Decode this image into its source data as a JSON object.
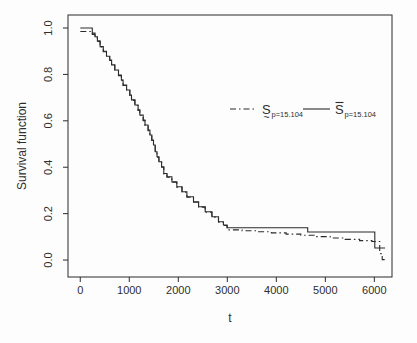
{
  "figure": {
    "background": "#fdfdfd",
    "line_color": "#2b2b2b",
    "text_color": "#2e2e2e"
  },
  "chart_data": {
    "type": "line",
    "subtype": "step-survival-curves",
    "title": "",
    "xlabel": "t",
    "ylabel": "Survival function",
    "x_range": [
      -250,
      6360
    ],
    "y_range": [
      -0.073,
      1.056
    ],
    "x_ticks": [
      0,
      1000,
      2000,
      3000,
      4000,
      5000,
      6000
    ],
    "x_tick_labels": [
      "0",
      "1000",
      "2000",
      "3000",
      "4000",
      "5000",
      "6000"
    ],
    "y_ticks": [
      0.0,
      0.2,
      0.4,
      0.6,
      0.8,
      1.0
    ],
    "y_tick_labels": [
      "0.0",
      "0.2",
      "0.4",
      "0.6",
      "0.8",
      "1.0"
    ],
    "grid": false,
    "legend_position": "inside-right-upper",
    "series": [
      {
        "name": "S~ (p=15.104) empirical estimator",
        "line_style": "solid",
        "start": [
          0,
          1.0
        ],
        "steps": [
          [
            245,
            0.978
          ],
          [
            300,
            0.962
          ],
          [
            350,
            0.945
          ],
          [
            405,
            0.92
          ],
          [
            470,
            0.9
          ],
          [
            535,
            0.878
          ],
          [
            600,
            0.862
          ],
          [
            640,
            0.841
          ],
          [
            705,
            0.819
          ],
          [
            780,
            0.797
          ],
          [
            840,
            0.776
          ],
          [
            875,
            0.754
          ],
          [
            945,
            0.733
          ],
          [
            1010,
            0.711
          ],
          [
            1045,
            0.69
          ],
          [
            1115,
            0.668
          ],
          [
            1180,
            0.647
          ],
          [
            1215,
            0.625
          ],
          [
            1285,
            0.603
          ],
          [
            1320,
            0.582
          ],
          [
            1385,
            0.56
          ],
          [
            1420,
            0.539
          ],
          [
            1460,
            0.517
          ],
          [
            1495,
            0.496
          ],
          [
            1530,
            0.467
          ],
          [
            1565,
            0.445
          ],
          [
            1605,
            0.424
          ],
          [
            1660,
            0.402
          ],
          [
            1705,
            0.373
          ],
          [
            1770,
            0.359
          ],
          [
            1870,
            0.337
          ],
          [
            1970,
            0.316
          ],
          [
            2075,
            0.294
          ],
          [
            2175,
            0.273
          ],
          [
            2310,
            0.251
          ],
          [
            2415,
            0.23
          ],
          [
            2550,
            0.208
          ],
          [
            2685,
            0.187
          ],
          [
            2820,
            0.165
          ],
          [
            2920,
            0.151
          ],
          [
            2995,
            0.139
          ],
          [
            4640,
            0.121
          ],
          [
            6010,
            0.052
          ]
        ],
        "end_t": 6220
      },
      {
        "name": "S-bar (p=15.104) fitted model",
        "line_style": "dashdot",
        "start": [
          0,
          0.985
        ],
        "steps": [
          [
            245,
            0.972
          ],
          [
            300,
            0.958
          ],
          [
            350,
            0.942
          ],
          [
            405,
            0.918
          ],
          [
            470,
            0.898
          ],
          [
            535,
            0.876
          ],
          [
            600,
            0.86
          ],
          [
            640,
            0.839
          ],
          [
            705,
            0.817
          ],
          [
            780,
            0.795
          ],
          [
            840,
            0.774
          ],
          [
            875,
            0.752
          ],
          [
            945,
            0.731
          ],
          [
            1010,
            0.709
          ],
          [
            1045,
            0.688
          ],
          [
            1115,
            0.666
          ],
          [
            1180,
            0.645
          ],
          [
            1215,
            0.623
          ],
          [
            1285,
            0.601
          ],
          [
            1320,
            0.58
          ],
          [
            1385,
            0.558
          ],
          [
            1420,
            0.537
          ],
          [
            1460,
            0.515
          ],
          [
            1495,
            0.494
          ],
          [
            1530,
            0.465
          ],
          [
            1565,
            0.443
          ],
          [
            1605,
            0.422
          ],
          [
            1660,
            0.4
          ],
          [
            1705,
            0.371
          ],
          [
            1770,
            0.357
          ],
          [
            1870,
            0.335
          ],
          [
            1970,
            0.314
          ],
          [
            2075,
            0.292
          ],
          [
            2175,
            0.271
          ],
          [
            2310,
            0.249
          ],
          [
            2415,
            0.228
          ],
          [
            2550,
            0.206
          ],
          [
            2685,
            0.185
          ],
          [
            2820,
            0.163
          ],
          [
            2920,
            0.149
          ],
          [
            2995,
            0.13
          ],
          [
            3300,
            0.126
          ],
          [
            3600,
            0.122
          ],
          [
            3900,
            0.117
          ],
          [
            4200,
            0.112
          ],
          [
            4500,
            0.107
          ],
          [
            4800,
            0.101
          ],
          [
            5100,
            0.095
          ],
          [
            5400,
            0.089
          ],
          [
            5700,
            0.084
          ],
          [
            5950,
            0.08
          ],
          [
            6110,
            0.028
          ],
          [
            6160,
            0.002
          ]
        ],
        "end_t": 6260
      }
    ],
    "legend": {
      "items": [
        {
          "sample": "dashdot",
          "base": "S",
          "accent": "tilde-below",
          "subscript": "p=15.104"
        },
        {
          "sample": "solid",
          "base": "S",
          "accent": "bar-above",
          "subscript": "p=15.104"
        }
      ]
    }
  }
}
